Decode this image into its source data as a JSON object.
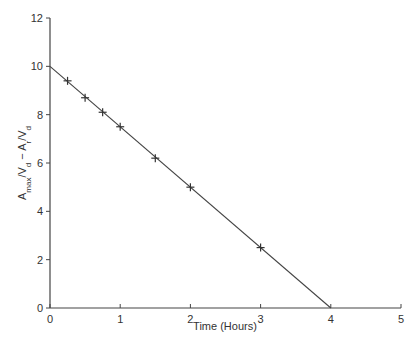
{
  "chart_data": {
    "type": "scatter",
    "title": "",
    "xlabel": "Time (Hours)",
    "ylabel": "A_max/V_d − A_r/V_d",
    "xlim": [
      0,
      5
    ],
    "ylim": [
      0,
      12
    ],
    "xticks": [
      0,
      1,
      2,
      3,
      4,
      5
    ],
    "yticks": [
      0,
      2,
      4,
      6,
      8,
      10,
      12
    ],
    "grid": false,
    "legend": null,
    "series": [
      {
        "name": "measured",
        "marker": "plus",
        "x": [
          0.25,
          0.5,
          0.75,
          1.0,
          1.5,
          2.0,
          3.0
        ],
        "y": [
          9.4,
          8.7,
          8.1,
          7.5,
          6.2,
          5.0,
          2.5
        ]
      },
      {
        "name": "fit line",
        "type": "line",
        "x": [
          0,
          4
        ],
        "y": [
          10,
          0
        ]
      }
    ]
  },
  "axes": {
    "x_title": "Time (Hours)",
    "y_title_main": "A",
    "y_title_sub1": "max",
    "y_title_mid": "/V",
    "y_title_sub2": "d",
    "y_title_mid2": " − A",
    "y_title_sub3": "r",
    "y_title_mid3": "/V",
    "y_title_sub4": "d"
  },
  "colors": {
    "axis": "#444444",
    "line": "#444444",
    "marker": "#333333"
  }
}
